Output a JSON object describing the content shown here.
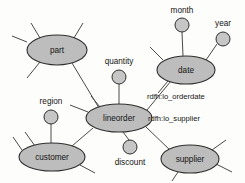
{
  "diagram": {
    "type": "rdf-graph-schema",
    "background_color": "#fdfdfb",
    "node_fill_color": "#bdbdbd",
    "node_stroke_color": "#2e2e2e",
    "edge_color": "#4a4a4a",
    "entities": [
      {
        "id": "part",
        "label": "part",
        "cx": 57,
        "cy": 50,
        "rx": 30,
        "ry": 15
      },
      {
        "id": "date",
        "label": "date",
        "cx": 186,
        "cy": 70,
        "rx": 29,
        "ry": 14
      },
      {
        "id": "lineorder",
        "label": "lineorder",
        "cx": 119,
        "cy": 118,
        "rx": 33,
        "ry": 14
      },
      {
        "id": "customer",
        "label": "customer",
        "cx": 52,
        "cy": 157,
        "rx": 33,
        "ry": 14
      },
      {
        "id": "supplier",
        "label": "supplier",
        "cx": 190,
        "cy": 159,
        "rx": 29,
        "ry": 14
      }
    ],
    "attributes": [
      {
        "id": "quantity",
        "label": "quantity",
        "cx": 119,
        "cy": 77,
        "r": 7,
        "label_x": 119,
        "label_y": 62
      },
      {
        "id": "month",
        "label": "month",
        "cx": 182,
        "cy": 25,
        "r": 7,
        "label_x": 182,
        "label_y": 11
      },
      {
        "id": "year",
        "label": "year",
        "cx": 223,
        "cy": 39,
        "r": 7,
        "label_x": 223,
        "label_y": 24
      },
      {
        "id": "region",
        "label": "region",
        "cx": 51,
        "cy": 117,
        "r": 7,
        "label_x": 51,
        "label_y": 102
      },
      {
        "id": "discount",
        "label": "discount",
        "cx": 130,
        "cy": 147,
        "r": 7,
        "label_x": 130,
        "label_y": 163
      }
    ],
    "edges": [
      {
        "id": "lineorder-part",
        "from": "lineorder",
        "to": "part",
        "x1": 99,
        "y1": 108,
        "x2": 72,
        "y2": 63,
        "label": ""
      },
      {
        "id": "lineorder-date",
        "from": "lineorder",
        "to": "date",
        "x1": 147,
        "y1": 110,
        "x2": 171,
        "y2": 81,
        "label": "rdfh:lo_orderdate",
        "label_x": 147,
        "label_y": 97
      },
      {
        "id": "lineorder-supplier",
        "from": "lineorder",
        "to": "supplier",
        "x1": 146,
        "y1": 127,
        "x2": 171,
        "y2": 151,
        "label": "rdfh:lo_supplier",
        "label_x": 148,
        "label_y": 119
      },
      {
        "id": "lineorder-customer",
        "from": "lineorder",
        "to": "customer",
        "x1": 93,
        "y1": 128,
        "x2": 72,
        "y2": 146,
        "label": ""
      },
      {
        "id": "lineorder-quantity",
        "from": "lineorder",
        "to": "quantity",
        "x1": 119,
        "y1": 104,
        "x2": 119,
        "y2": 84,
        "label": ""
      },
      {
        "id": "lineorder-discount",
        "from": "lineorder",
        "to": "discount",
        "x1": 123,
        "y1": 132,
        "x2": 129,
        "y2": 140,
        "label": ""
      },
      {
        "id": "date-month",
        "from": "date",
        "to": "month",
        "x1": 183,
        "y1": 56,
        "x2": 182,
        "y2": 32,
        "label": ""
      },
      {
        "id": "date-year",
        "from": "date",
        "to": "year",
        "x1": 206,
        "y1": 60,
        "x2": 217,
        "y2": 44,
        "label": ""
      },
      {
        "id": "customer-region",
        "from": "customer",
        "to": "region",
        "x1": 51,
        "y1": 143,
        "x2": 51,
        "y2": 124,
        "label": ""
      }
    ],
    "stubs": [
      {
        "id": "part-stub-nw",
        "x1": 40,
        "y1": 38,
        "x2": 31,
        "y2": 23
      },
      {
        "id": "part-stub-ne",
        "x1": 74,
        "y1": 38,
        "x2": 83,
        "y2": 23
      },
      {
        "id": "part-stub-sw",
        "x1": 40,
        "y1": 62,
        "x2": 27,
        "y2": 78
      },
      {
        "id": "part-stub-w",
        "x1": 27,
        "y1": 42,
        "x2": 12,
        "y2": 36
      },
      {
        "id": "date-stub-w",
        "x1": 163,
        "y1": 60,
        "x2": 150,
        "y2": 47
      },
      {
        "id": "date-stub-sw",
        "x1": 168,
        "y1": 81,
        "x2": 158,
        "y2": 93
      },
      {
        "id": "lineorder-stub-w",
        "x1": 88,
        "y1": 112,
        "x2": 70,
        "y2": 105
      },
      {
        "id": "lineorder-stub-nw",
        "x1": 100,
        "y1": 107,
        "x2": 91,
        "y2": 96
      },
      {
        "id": "customer-stub-nw",
        "x1": 35,
        "y1": 146,
        "x2": 25,
        "y2": 132
      },
      {
        "id": "customer-stub-n",
        "x1": 22,
        "y1": 150,
        "x2": 13,
        "y2": 137
      },
      {
        "id": "customer-stub-se",
        "x1": 80,
        "y1": 165,
        "x2": 95,
        "y2": 173
      },
      {
        "id": "supplier-stub-ne",
        "x1": 212,
        "y1": 150,
        "x2": 226,
        "y2": 140
      },
      {
        "id": "supplier-stub-e",
        "x1": 216,
        "y1": 164,
        "x2": 232,
        "y2": 172
      },
      {
        "id": "supplier-stub-sw",
        "x1": 178,
        "y1": 172,
        "x2": 172,
        "y2": 181
      }
    ]
  }
}
